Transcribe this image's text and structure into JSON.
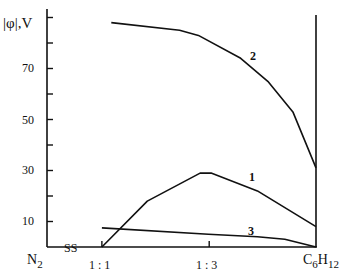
{
  "chart_data": {
    "type": "line",
    "title": "",
    "ylabel": "|φ|,V",
    "xlabel": "",
    "ylim": [
      0,
      92
    ],
    "yticks_labeled": [
      10,
      30,
      50,
      70
    ],
    "yticks_minor": [
      20,
      40,
      60,
      80,
      90
    ],
    "x_categories": [
      {
        "label": "N2",
        "pos": 0
      },
      {
        "label": "1 : 1",
        "pos": 0.204
      },
      {
        "label": "1 : 3",
        "pos": 0.603
      },
      {
        "label": "C6H12",
        "pos": 1
      }
    ],
    "x_annotation": "SS",
    "grid": false,
    "legend": "inline curve numbers",
    "series": [
      {
        "name": "1",
        "points": [
          [
            0.204,
            0
          ],
          [
            0.373,
            18
          ],
          [
            0.569,
            29
          ],
          [
            0.61,
            29
          ],
          [
            0.782,
            22
          ],
          [
            1.0,
            8
          ]
        ]
      },
      {
        "name": "2",
        "points": [
          [
            0.239,
            88
          ],
          [
            0.493,
            85
          ],
          [
            0.563,
            83
          ],
          [
            0.72,
            74
          ],
          [
            0.821,
            65
          ],
          [
            0.914,
            53
          ],
          [
            1.0,
            31
          ]
        ]
      },
      {
        "name": "3",
        "points": [
          [
            0.204,
            7.5
          ],
          [
            0.6,
            5
          ],
          [
            0.782,
            4
          ],
          [
            0.884,
            3
          ],
          [
            1.0,
            0
          ]
        ]
      }
    ]
  },
  "labels": {
    "ylabel": "|φ|,V",
    "y10": "10",
    "y30": "30",
    "y50": "50",
    "y70": "70",
    "xN2_main": "N",
    "xN2_sub": "2",
    "xSS": "SS",
    "x11": "1 : 1",
    "x13": "1 : 3",
    "xC": "C",
    "xC_sub6": "6",
    "xH": "H",
    "xH_sub12": "12",
    "curve1": "1",
    "curve2": "2",
    "curve3": "3"
  }
}
